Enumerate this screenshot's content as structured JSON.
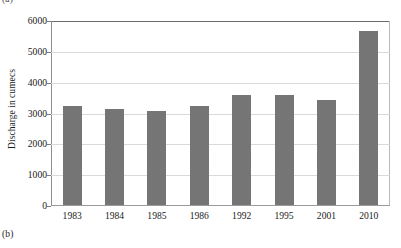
{
  "figure": {
    "caption_top": "(a)",
    "caption_bottom": "(b)"
  },
  "chart_data": {
    "type": "bar",
    "title": "",
    "subtitle": "",
    "xlabel": "",
    "ylabel": "Discharge in cumecs",
    "categories": [
      "1983",
      "1984",
      "1985",
      "1986",
      "1992",
      "1995",
      "2001",
      "2010"
    ],
    "values": [
      3220,
      3130,
      3040,
      3220,
      3570,
      3560,
      3400,
      5650
    ],
    "series": [
      {
        "name": "Discharge",
        "values": [
          3220,
          3130,
          3040,
          3220,
          3570,
          3560,
          3400,
          5650
        ],
        "color": "#757575"
      }
    ],
    "ylim": [
      0,
      6000
    ],
    "yticks": [
      0,
      1000,
      2000,
      3000,
      4000,
      5000,
      6000
    ],
    "ytick_labels": [
      "0",
      "1000",
      "2000",
      "3000",
      "4000",
      "5000",
      "6000"
    ],
    "xtick_labels": [
      "1983",
      "1984",
      "1985",
      "1986",
      "1992",
      "1995",
      "2001",
      "2010"
    ],
    "grid": true,
    "grid_axis": "y",
    "legend": false,
    "legend_position": "none",
    "bar_color": "#757575",
    "gridline_color": "#d9d9d9",
    "axis_color": "#6b6b6b",
    "background": "#ffffff"
  }
}
